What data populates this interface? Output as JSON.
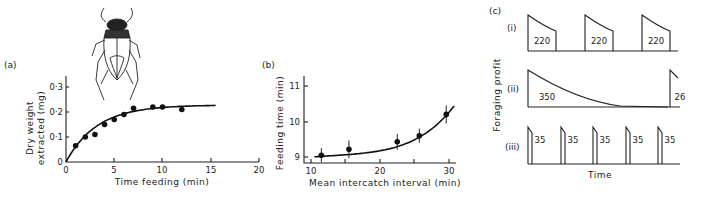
{
  "chart_data": [
    {
      "panel": "(a)",
      "type": "scatter",
      "title": "",
      "xlabel": "Time feeding (min)",
      "ylabel": "Dry weight extracted (mg)",
      "xlim": [
        0,
        20
      ],
      "ylim": [
        0,
        0.35
      ],
      "xticks": [
        0,
        5,
        10,
        15,
        20
      ],
      "xtick_labels": [
        "0",
        "5",
        "10",
        "15",
        "20"
      ],
      "yticks": [
        0,
        0.1,
        0.2,
        0.3
      ],
      "ytick_labels": [
        "0",
        "0·1",
        "0·2",
        "0·3"
      ],
      "grid": false,
      "points": [
        {
          "x": 1,
          "y": 0.065
        },
        {
          "x": 2,
          "y": 0.1
        },
        {
          "x": 3,
          "y": 0.11
        },
        {
          "x": 4,
          "y": 0.15
        },
        {
          "x": 5,
          "y": 0.17
        },
        {
          "x": 6,
          "y": 0.19
        },
        {
          "x": 7,
          "y": 0.215
        },
        {
          "x": 9,
          "y": 0.22
        },
        {
          "x": 10,
          "y": 0.22
        },
        {
          "x": 12,
          "y": 0.21
        }
      ],
      "fit_curve": {
        "form": "asymptotic",
        "asymptote": 0.228,
        "x_range": [
          0,
          15.5
        ]
      },
      "illustration": "water beetle"
    },
    {
      "panel": "(b)",
      "type": "scatter",
      "title": "",
      "xlabel": "Mean intercatch interval (min)",
      "ylabel": "Feeding time (min)",
      "xlim": [
        8,
        33
      ],
      "ylim": [
        8.8,
        11.3
      ],
      "xticks": [
        10,
        20,
        30
      ],
      "xtick_labels": [
        "10",
        "20",
        "30"
      ],
      "yticks": [
        9,
        10,
        11
      ],
      "ytick_labels": [
        "9",
        "10",
        "11"
      ],
      "grid": false,
      "points": [
        {
          "x": 11.5,
          "y": 9.05,
          "err": 0.2
        },
        {
          "x": 15.5,
          "y": 9.22,
          "err": 0.25
        },
        {
          "x": 22.5,
          "y": 9.43,
          "err": 0.22
        },
        {
          "x": 25.7,
          "y": 9.6,
          "err": 0.2
        },
        {
          "x": 29.6,
          "y": 10.2,
          "err": 0.25
        }
      ],
      "fit_curve": {
        "form": "increasing-convex",
        "x_range": [
          10.5,
          30.8
        ]
      }
    },
    {
      "panel": "(c)",
      "type": "line",
      "title": "",
      "xlabel": "Time",
      "ylabel": "Foraging profit",
      "series": [
        {
          "name": "(i)",
          "pulse_labels": [
            "220",
            "220",
            "220"
          ]
        },
        {
          "name": "(ii)",
          "pulse_labels": [
            "350",
            "26"
          ]
        },
        {
          "name": "(iii)",
          "pulse_labels": [
            "35",
            "35",
            "35",
            "35",
            "35"
          ]
        }
      ]
    }
  ],
  "labels": {
    "panel_a": "(a)",
    "panel_b": "(b)",
    "panel_c": "(c)",
    "a_xlabel": "Time feeding (min)",
    "a_ylabel_1": "Dry weight",
    "a_ylabel_2": "extracted (mg)",
    "b_xlabel": "Mean intercatch interval (min)",
    "b_ylabel": "Feeding time (min)",
    "c_xlabel": "Time",
    "c_ylabel": "Foraging profit",
    "c_row_i": "(i)",
    "c_row_ii": "(ii)",
    "c_row_iii": "(iii)"
  }
}
